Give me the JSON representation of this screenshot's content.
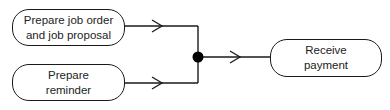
{
  "diagram": {
    "type": "activity-join",
    "nodes": [
      {
        "id": "job-order",
        "lines": [
          "Prepare job order",
          "and job proposal"
        ]
      },
      {
        "id": "reminder",
        "lines": [
          "Prepare",
          "reminder"
        ]
      },
      {
        "id": "payment",
        "lines": [
          "Receive",
          "payment"
        ]
      }
    ],
    "join": {
      "shape": "filled-circle"
    },
    "edges": [
      {
        "from": "job-order",
        "to": "join"
      },
      {
        "from": "reminder",
        "to": "join"
      },
      {
        "from": "join",
        "to": "payment"
      }
    ],
    "colors": {
      "stroke": "#1a1a1a",
      "background": "#ffffff"
    }
  }
}
